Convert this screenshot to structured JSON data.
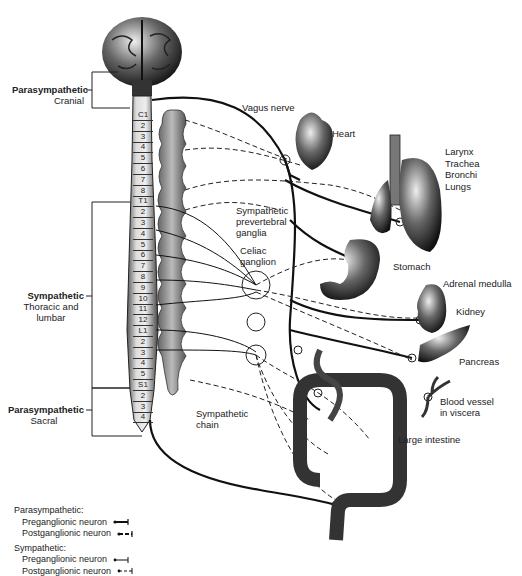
{
  "divisions": [
    {
      "name": "Parasympathetic",
      "sub": "Cranial"
    },
    {
      "name": "Sympathetic",
      "sub": "Thoracic and lumbar"
    },
    {
      "name": "Parasympathetic",
      "sub": "Sacral"
    }
  ],
  "vertebrae": [
    "C1",
    "2",
    "3",
    "4",
    "5",
    "6",
    "7",
    "8",
    "T1",
    "2",
    "3",
    "4",
    "5",
    "6",
    "7",
    "8",
    "9",
    "10",
    "11",
    "12",
    "L1",
    "2",
    "3",
    "4",
    "5",
    "S1",
    "2",
    "3",
    "4"
  ],
  "labels": {
    "vagus_nerve": "Vagus nerve",
    "heart": "Heart",
    "larynx": "Larynx",
    "trachea": "Trachea",
    "bronchi": "Bronchi",
    "lungs": "Lungs",
    "prevertebral_1": "Sympathetic",
    "prevertebral_2": "prevertebral",
    "prevertebral_3": "ganglia",
    "celiac_1": "Celiac",
    "celiac_2": "ganglion",
    "stomach": "Stomach",
    "adrenal": "Adrenal medulla",
    "kidney": "Kidney",
    "pancreas": "Pancreas",
    "blood_vessel_1": "Blood vessel",
    "blood_vessel_2": "in viscera",
    "sympathetic_chain_1": "Sympathetic",
    "sympathetic_chain_2": "chain",
    "large_intestine": "Large intestine"
  },
  "legend": {
    "parasympathetic_title": "Parasympathetic:",
    "para_pre": "Preganglionic neuron",
    "para_post": "Postganglionic neuron",
    "sympathetic_title": "Sympathetic:",
    "sym_pre": "Preganglionic neuron",
    "sym_post": "Postganglionic neuron"
  }
}
